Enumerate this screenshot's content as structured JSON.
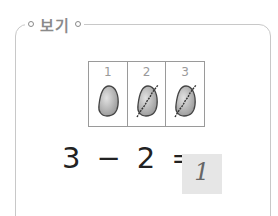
{
  "example": {
    "title": "보기",
    "table": {
      "cells": [
        {
          "number": "1",
          "icon": "egg-icon",
          "crossed": false
        },
        {
          "number": "2",
          "icon": "egg-crossed-icon",
          "crossed": true
        },
        {
          "number": "3",
          "icon": "egg-crossed-icon",
          "crossed": true
        }
      ]
    },
    "equation": {
      "left": "3",
      "operator": "−",
      "right": "2",
      "equals": "=",
      "answer": "1"
    }
  },
  "colors": {
    "frame": "#c8c8c8",
    "legend_text": "#8a8a8a",
    "answer_bg": "#e6e6e6"
  }
}
